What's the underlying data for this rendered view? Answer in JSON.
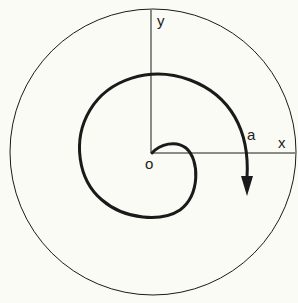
{
  "diagram": {
    "labels": {
      "y_axis": "y",
      "x_axis": "x",
      "origin": "o",
      "curve": "a"
    },
    "colors": {
      "background": "#fbfbf5",
      "stroke": "#1a1a1a"
    }
  }
}
